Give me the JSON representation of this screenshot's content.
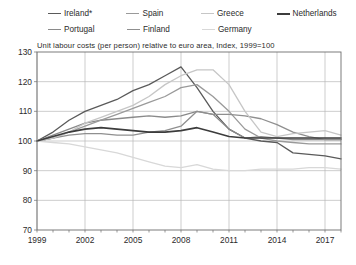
{
  "chart_data": {
    "type": "line",
    "title": "Unit labour costs (per person) relative to euro area, Index, 1999=100",
    "xlabel": "",
    "ylabel": "",
    "ylim": [
      70,
      130
    ],
    "yticks": [
      70,
      80,
      90,
      100,
      110,
      120,
      130
    ],
    "xlim": [
      1999,
      2018
    ],
    "xticks": [
      1999,
      2002,
      2005,
      2008,
      2011,
      2014,
      2017
    ],
    "xticklabels": [
      "1999",
      "2002",
      "2005",
      "2008",
      "2011",
      "2014",
      "2017"
    ],
    "minor_xticks_every": 1,
    "grid": true,
    "legend_position": "top",
    "x": [
      1999,
      2000,
      2001,
      2002,
      2003,
      2004,
      2005,
      2006,
      2007,
      2008,
      2009,
      2010,
      2011,
      2012,
      2013,
      2014,
      2015,
      2016,
      2017,
      2018
    ],
    "series": [
      {
        "name": "Ireland*",
        "color": "#5a5a5a",
        "width": 1.3,
        "values": [
          100,
          103,
          107,
          110,
          112,
          114,
          117,
          119,
          122,
          125,
          118,
          110,
          104,
          101,
          100,
          99.5,
          96,
          95.5,
          95,
          94
        ]
      },
      {
        "name": "Portugal",
        "color": "#8a8a8a",
        "width": 1.3,
        "values": [
          100,
          102,
          104,
          106,
          107,
          107.5,
          108,
          108.5,
          108,
          108.5,
          110,
          109,
          104,
          101,
          101.5,
          101,
          100.5,
          100.5,
          100.5,
          100.5
        ]
      },
      {
        "name": "Spain",
        "color": "#9a9a9a",
        "width": 1.3,
        "values": [
          100,
          101,
          103,
          105,
          107,
          109,
          111,
          113,
          115,
          118,
          119,
          115,
          110,
          104,
          101,
          100,
          99.5,
          99,
          99,
          99
        ]
      },
      {
        "name": "Finland",
        "color": "#8f8f8f",
        "width": 1.3,
        "values": [
          100,
          101,
          102,
          102.5,
          102.5,
          102,
          102,
          103,
          103.5,
          105,
          110,
          109,
          109,
          108.5,
          107.5,
          105.5,
          103,
          101.5,
          100.5,
          100.5
        ]
      },
      {
        "name": "Greece",
        "color": "#c6c6c6",
        "width": 1.3,
        "values": [
          100,
          101,
          103,
          106,
          108,
          110,
          112,
          115,
          119,
          122,
          124,
          124,
          119,
          110,
          103,
          101.5,
          102.5,
          103,
          103.5,
          102
        ]
      },
      {
        "name": "Germany",
        "color": "#d8d8d8",
        "width": 1.3,
        "values": [
          100,
          99.5,
          99,
          98,
          97,
          96,
          94.5,
          93,
          91.5,
          91,
          92,
          90.5,
          90,
          90,
          90.5,
          90.5,
          90.5,
          91,
          91,
          90.5
        ]
      },
      {
        "name": "Netherlands",
        "color": "#3c3c3c",
        "width": 1.6,
        "values": [
          100,
          101.5,
          103,
          104,
          104.5,
          104,
          103.5,
          103,
          103,
          103.5,
          104.5,
          103,
          101.5,
          101,
          101,
          101,
          101,
          101,
          101,
          101
        ]
      }
    ]
  },
  "legend": {
    "rows": [
      [
        {
          "label": "Ireland*",
          "color": "#5a5a5a",
          "width": "1.6px"
        },
        {
          "label": "Spain",
          "color": "#9a9a9a",
          "width": "1.6px"
        },
        {
          "label": "Greece",
          "color": "#c6c6c6",
          "width": "1.6px"
        },
        {
          "label": "Netherlands",
          "color": "#3c3c3c",
          "width": "2.2px"
        }
      ],
      [
        {
          "label": "Portugal",
          "color": "#8a8a8a",
          "width": "1.6px"
        },
        {
          "label": "Finland",
          "color": "#8f8f8f",
          "width": "1.6px"
        },
        {
          "label": "Germany",
          "color": "#d8d8d8",
          "width": "1.6px"
        }
      ]
    ]
  },
  "colors": {
    "axis": "#6e6e6e",
    "grid": "#b8b8b8",
    "text": "#2b2b2b",
    "background": "#ffffff"
  }
}
